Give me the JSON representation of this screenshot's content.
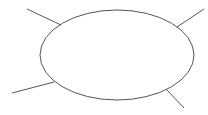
{
  "diagram": {
    "type": "spider-map",
    "stroke_color": "#555555",
    "background": "#ffffff",
    "center": {
      "label": "",
      "cx": 117,
      "cy": 55,
      "rx": 77,
      "ry": 45
    },
    "branches": [
      {
        "position": "top-left",
        "x1": 27,
        "y1": 9,
        "x2": 61,
        "y2": 25,
        "label": ""
      },
      {
        "position": "top-right",
        "x1": 204,
        "y1": 9,
        "x2": 177,
        "y2": 27,
        "label": ""
      },
      {
        "position": "bottom-left",
        "x1": 12,
        "y1": 93,
        "x2": 54,
        "y2": 82,
        "label": ""
      },
      {
        "position": "bottom-right",
        "x1": 184,
        "y1": 108,
        "x2": 166,
        "y2": 89,
        "label": ""
      }
    ]
  }
}
